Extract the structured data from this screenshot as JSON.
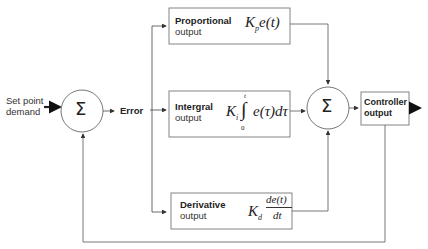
{
  "diagram": {
    "input": {
      "label_line1": "Set point",
      "label_line2": "demand"
    },
    "summing_junction_1": {
      "symbol": "Σ"
    },
    "error_label": "Error",
    "blocks": [
      {
        "id": "proportional",
        "title": "Proportional",
        "subtitle": "output",
        "formula_K": "K",
        "formula_sub": "p",
        "formula_body": "e(t)"
      },
      {
        "id": "integral",
        "title": "Intergral",
        "subtitle": "output",
        "formula_K": "K",
        "formula_sub": "i",
        "formula_body": "e(τ)dτ",
        "upper_limit": "t",
        "lower_limit": "0",
        "integral_sign": "∫"
      },
      {
        "id": "derivative",
        "title": "Derivative",
        "subtitle": "output",
        "formula_K": "K",
        "formula_sub": "d",
        "numerator": "de(t)",
        "denominator": "dt"
      }
    ],
    "summing_junction_2": {
      "symbol": "Σ"
    },
    "output_block": {
      "line1": "Controller",
      "line2": "output"
    },
    "colors": {
      "line": "#555555",
      "box_border": "#666666",
      "text": "#222222"
    }
  }
}
